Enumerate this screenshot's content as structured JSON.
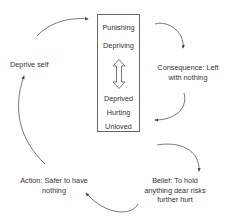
{
  "diagram": {
    "type": "cycle",
    "center_box": {
      "top_words": [
        "Punishing",
        "Depriving"
      ],
      "bottom_words": [
        "Deprived",
        "Hurting",
        "Unloved"
      ],
      "connector": "double-headed vertical arrow"
    },
    "nodes": [
      {
        "id": "deprive-self",
        "text": "Deprive self"
      },
      {
        "id": "consequence",
        "line1": "Consequence: Left",
        "line2": "with nothing"
      },
      {
        "id": "belief",
        "line1": "Belief: To hold",
        "line2": "anything dear risks",
        "line3": "further hurt"
      },
      {
        "id": "action",
        "line1": "Action: Safer to have",
        "line2": "nothing"
      }
    ],
    "flow": [
      "Deprive self -> Center box",
      "Center box -> Consequence",
      "Consequence -> Center box",
      "Center box -> Belief",
      "Belief -> Action",
      "Action -> Deprive self"
    ],
    "colors": {
      "line": "#555555",
      "text": "#333333",
      "box_border": "#666666"
    }
  }
}
